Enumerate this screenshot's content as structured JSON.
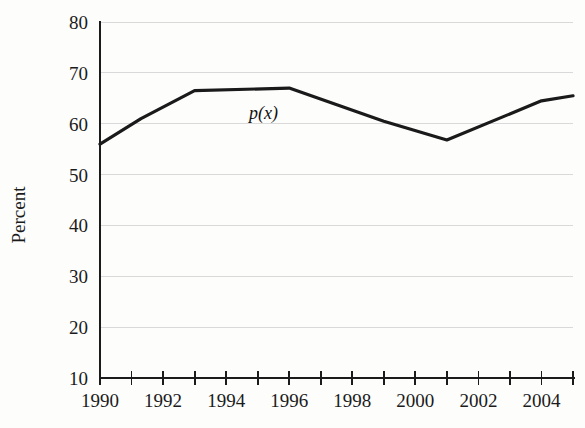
{
  "chart_data": {
    "type": "line",
    "title": "",
    "xlabel": "",
    "ylabel": "Percent",
    "xlim": [
      1989.5,
      2005.0
    ],
    "ylim": [
      10,
      80
    ],
    "grid": true,
    "legend": "none",
    "series_label": "p(x)",
    "series": [
      {
        "name": "p(x)",
        "x": [
          1990,
          1991.3,
          1993,
          1996,
          1999,
          2001,
          2004,
          2005
        ],
        "values": [
          56,
          61,
          66.5,
          67,
          60.5,
          56.8,
          64.5,
          65.5
        ]
      }
    ],
    "x_ticks": [
      1990,
      1991,
      1992,
      1993,
      1994,
      1995,
      1996,
      1997,
      1998,
      1999,
      2000,
      2001,
      2002,
      2003,
      2004,
      2005
    ],
    "x_tick_labels": [
      "1990",
      "",
      "1992",
      "",
      "1994",
      "",
      "1996",
      "",
      "1998",
      "",
      "2000",
      "",
      "2002",
      "",
      "2004",
      ""
    ],
    "y_ticks": [
      10,
      20,
      30,
      40,
      50,
      60,
      70,
      80
    ],
    "y_tick_labels": [
      "10",
      "20",
      "30",
      "40",
      "50",
      "60",
      "70",
      "80"
    ]
  },
  "axes": {
    "y_axis_title": "Percent"
  },
  "annotations": {
    "curve_label": "p(x)"
  },
  "colors": {
    "line": "#1a1a1a",
    "grid": "#d9d9d9",
    "axis": "#1b1b1b",
    "background": "#fdfdfc"
  }
}
